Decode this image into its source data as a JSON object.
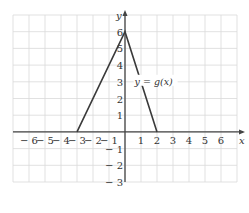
{
  "chart_data": {
    "type": "line",
    "title": "",
    "xlabel": "x",
    "ylabel": "y",
    "xlim": [
      -7,
      7
    ],
    "ylim": [
      -3,
      7
    ],
    "grid": true,
    "x_ticks": [
      -6,
      -5,
      -4,
      -3,
      -2,
      -1,
      1,
      2,
      3,
      4,
      5,
      6
    ],
    "y_ticks": [
      6,
      5,
      4,
      3,
      2,
      1,
      -1,
      -2,
      -3
    ],
    "x_tick_labels": [
      "− 6",
      "− 5",
      "− 4",
      "− 3",
      "− 2",
      "− 1",
      "1",
      "2",
      "3",
      "4",
      "5",
      "6"
    ],
    "y_tick_labels": [
      "6",
      "5",
      "4",
      "3",
      "2",
      "1",
      "− 1",
      "− 2",
      "− 3"
    ],
    "series": [
      {
        "name": "y = g(x)",
        "points": [
          [
            -3,
            0
          ],
          [
            0,
            6
          ],
          [
            2,
            0
          ]
        ]
      }
    ],
    "annotations": [
      {
        "text": "y = g(x)",
        "x": 0.6,
        "y": 3
      }
    ],
    "colors": {
      "grid": "#d9d9d9",
      "axis": "#444444",
      "line": "#3a3a3a"
    }
  }
}
